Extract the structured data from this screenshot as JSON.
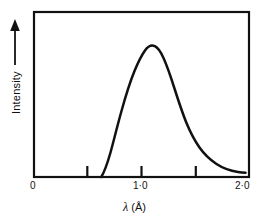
{
  "chart_data": {
    "type": "line",
    "title": "",
    "subtitle": "",
    "xlabel": "λ (Å)",
    "ylabel": "Intensity",
    "ylabel_arrow": "up-arrow",
    "xlim": [
      0,
      2.0
    ],
    "ylim": [
      0,
      1.0
    ],
    "grid": false,
    "legend": null,
    "frame": "box",
    "xticks": [
      {
        "value": 0,
        "label": "0",
        "tick_mark": false
      },
      {
        "value": 0.5,
        "label": "",
        "tick_mark": true
      },
      {
        "value": 1.0,
        "label": "1·0",
        "tick_mark": true
      },
      {
        "value": 1.5,
        "label": "",
        "tick_mark": true
      },
      {
        "value": 2.0,
        "label": "2·0",
        "tick_mark": false
      }
    ],
    "yticks": [],
    "ytick_labels_shown": false,
    "annotations": [],
    "series": [
      {
        "name": "continuous X-ray spectrum",
        "color": "#111111",
        "linewidth": 2.4,
        "x": [
          0.62,
          0.65,
          0.68,
          0.71,
          0.74,
          0.78,
          0.82,
          0.86,
          0.9,
          0.94,
          0.98,
          1.02,
          1.06,
          1.1,
          1.15,
          1.2,
          1.25,
          1.3,
          1.35,
          1.4,
          1.45,
          1.5,
          1.55,
          1.6,
          1.65,
          1.7,
          1.75,
          1.8,
          1.85,
          1.9,
          1.95
        ],
        "y": [
          0.0,
          0.075,
          0.18,
          0.3,
          0.42,
          0.56,
          0.69,
          0.8,
          0.89,
          0.95,
          0.985,
          1.0,
          0.995,
          0.975,
          0.935,
          0.875,
          0.805,
          0.73,
          0.655,
          0.58,
          0.51,
          0.445,
          0.385,
          0.335,
          0.29,
          0.25,
          0.215,
          0.185,
          0.155,
          0.125,
          0.1
        ]
      }
    ]
  },
  "figure": {
    "background_color": "#ffffff",
    "axis_color": "#111111",
    "text_color": "#111111"
  }
}
